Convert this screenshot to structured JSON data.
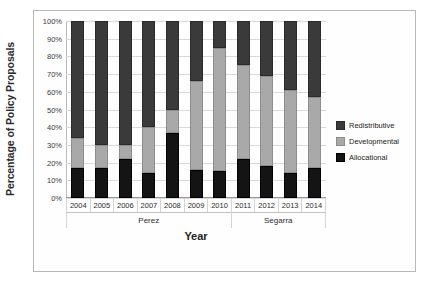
{
  "chart_data": {
    "type": "bar",
    "subtype": "stacked-100-percent",
    "title": "",
    "xlabel": "Year",
    "ylabel": "Percentage of Policy Proposals",
    "categories": [
      "2004",
      "2005",
      "2006",
      "2007",
      "2008",
      "2009",
      "2010",
      "2011",
      "2012",
      "2013",
      "2014"
    ],
    "ylim": [
      0,
      100
    ],
    "yticks": [
      "0%",
      "10%",
      "20%",
      "30%",
      "40%",
      "50%",
      "60%",
      "70%",
      "80%",
      "90%",
      "100%"
    ],
    "ytick_values": [
      0,
      10,
      20,
      30,
      40,
      50,
      60,
      70,
      80,
      90,
      100
    ],
    "grid": true,
    "legend_position": "right",
    "stack_order_bottom_to_top": [
      "Allocational",
      "Developmental",
      "Redistributive"
    ],
    "series": [
      {
        "name": "Allocational",
        "color": "#141414",
        "pattern": "solid",
        "values": [
          17,
          17,
          22,
          14,
          37,
          16,
          15,
          22,
          18,
          14,
          17
        ]
      },
      {
        "name": "Developmental",
        "color": "#a9a9a9",
        "pattern": "light-dotted",
        "values": [
          17,
          13,
          8,
          26,
          13,
          50,
          70,
          53,
          51,
          47,
          40
        ]
      },
      {
        "name": "Redistributive",
        "color": "#3a3a3a",
        "pattern": "dark-checkered",
        "values": [
          66,
          70,
          70,
          60,
          50,
          34,
          15,
          25,
          31,
          39,
          43
        ]
      }
    ],
    "group_bands": [
      {
        "label": "Perez",
        "categories": [
          "2004",
          "2005",
          "2006",
          "2007",
          "2008",
          "2009",
          "2010"
        ]
      },
      {
        "label": "Segarra",
        "categories": [
          "2011",
          "2012",
          "2013",
          "2014"
        ]
      }
    ]
  },
  "legend": {
    "items": [
      {
        "label": "Redistributive",
        "color": "#3a3a3a"
      },
      {
        "label": "Developmental",
        "color": "#a9a9a9"
      },
      {
        "label": "Allocational",
        "color": "#141414"
      }
    ]
  },
  "caption": ""
}
